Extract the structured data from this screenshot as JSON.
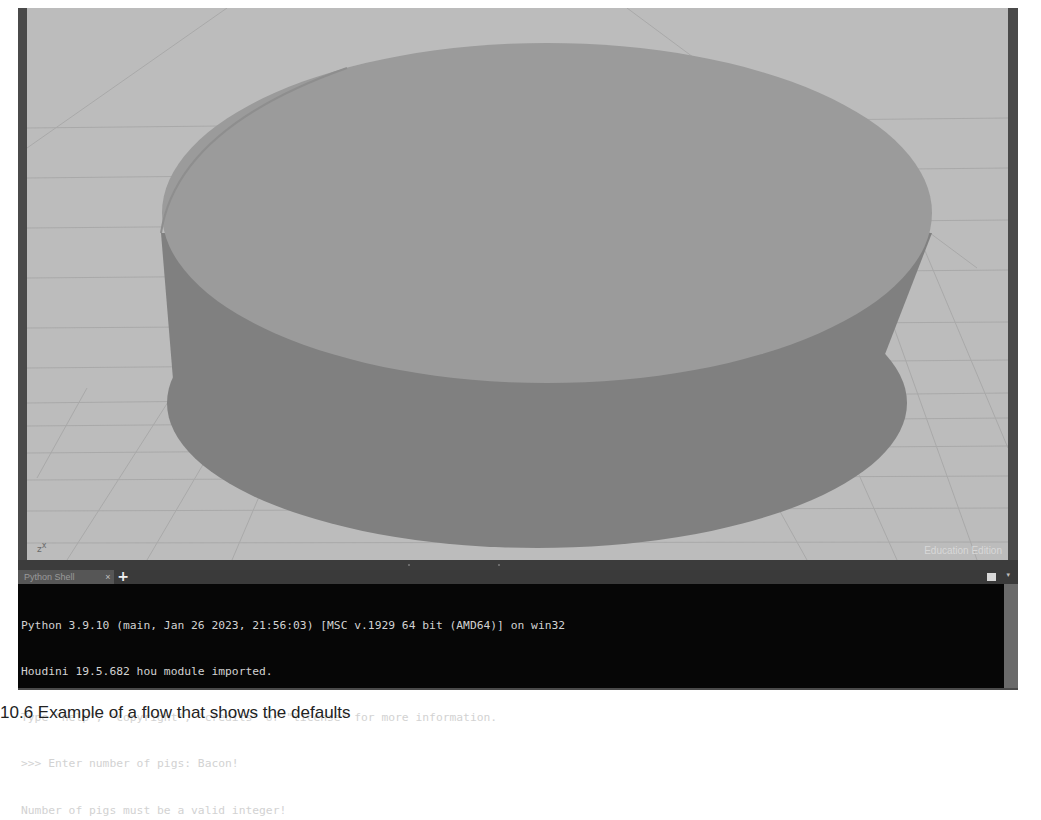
{
  "viewport": {
    "axis_indicator": {
      "z": "z",
      "x": "x"
    },
    "watermark": "Education Edition",
    "colors": {
      "background": "#bcbcbc",
      "grid_line": "#a9a9a9",
      "cylinder_top": "#9b9b9b",
      "cylinder_side": "#808080",
      "frame": "#4a4a4a"
    },
    "object": "cylinder"
  },
  "pane": {
    "tabs": [
      {
        "label": "Python Shell",
        "close_label": "×",
        "active": true
      }
    ],
    "add_tab_label": "+",
    "menu_arrow": "▾"
  },
  "shell": {
    "lines": [
      "Python 3.9.10 (main, Jan 26 2023, 21:56:03) [MSC v.1929 64 bit (AMD64)] on win32",
      "Houdini 19.5.682 hou module imported.",
      "Type \"help\", \"copyright\", \"credits\" or \"license\" for more information.",
      ">>> Enter number of pigs: Bacon!",
      "Number of pigs must be a valid integer!"
    ],
    "colors": {
      "background": "#060606",
      "text": "#d2d2d2"
    }
  },
  "caption": {
    "text": "10.6  Example of a flow that shows the defaults"
  }
}
